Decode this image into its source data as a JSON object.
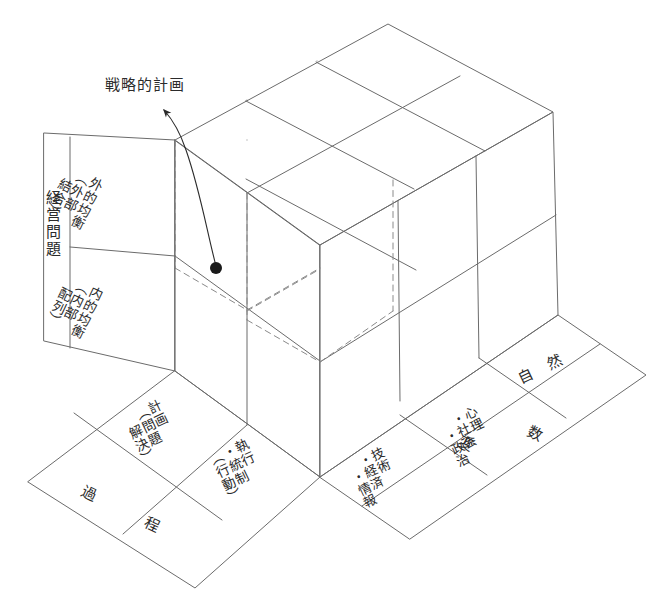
{
  "figure": {
    "type": "isometric-cube-matrix",
    "background": "#ffffff",
    "line_color": "#6b6b6b",
    "text_color": "#2b2b2b",
    "dimensions": {
      "width": 669,
      "height": 613
    }
  },
  "annotation": {
    "label": "戦略的計画",
    "marker": "filled-dot",
    "marker_position": {
      "x": 216,
      "y": 268
    },
    "arrow_style": "curved-with-arrowhead"
  },
  "axes": {
    "left_panel": {
      "axis_label": "経営問題",
      "cells": [
        {
          "id": "external-balance",
          "text": "外的均衡\n（外部\n　結合）"
        },
        {
          "id": "internal-balance",
          "text": "内的均衡\n（内部\n　配列）"
        }
      ]
    },
    "front_left_band": {
      "axis_label_parts": [
        "過",
        "程"
      ],
      "axis_label": "過程",
      "cells": [
        {
          "id": "planning",
          "text": "計画\n（問題\n　解決）"
        },
        {
          "id": "execution-control",
          "text": "執行\n・統制\n（行動）"
        }
      ]
    },
    "front_right_band": {
      "axis_label_parts": [
        "変",
        "数"
      ],
      "axis_label": "変数",
      "cells": [
        {
          "id": "technical-economic-information",
          "text": "技術\n・経済\n　・情報"
        },
        {
          "id": "psychological-social-political",
          "text": "心理\n・社会\n　・政治"
        },
        {
          "id": "natural",
          "text": "自 然"
        }
      ]
    }
  },
  "cube": {
    "top_face_grid": {
      "cols": 3,
      "rows": 2
    },
    "right_face_grid": {
      "cols": 3,
      "rows": 2
    },
    "left_face_grid": {
      "cols": 2,
      "rows": 2
    },
    "hidden_edges": "dashed",
    "highlighted_cell": "top-left-near-cell"
  }
}
